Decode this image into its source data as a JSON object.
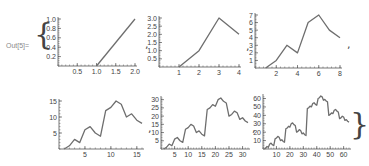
{
  "output_label": "Out[5]=",
  "open_brace": "{",
  "close_brace": "}",
  "separator": ",",
  "colors": {
    "line": "#6e6e6e",
    "axis": "#555555",
    "tick_label": "#444444"
  },
  "chart_data": [
    {
      "type": "line",
      "x": [
        1,
        2
      ],
      "values": [
        0,
        1
      ],
      "xticks": [
        0.5,
        1.0,
        1.5,
        2.0
      ],
      "xtick_labels": [
        "0.5",
        "1.0",
        "1.5",
        "2.0"
      ],
      "yticks": [
        0.2,
        0.4,
        0.6,
        0.8,
        1.0
      ],
      "ytick_labels": [
        "0.2",
        "0.4",
        "0.6",
        "0.8",
        "1.0"
      ],
      "xlim": [
        0,
        2
      ],
      "ylim": [
        0,
        1
      ],
      "frame": {
        "x0": 58,
        "x1": 135,
        "y0": 66,
        "y1": 19
      }
    },
    {
      "type": "line",
      "x": [
        1,
        2,
        3,
        4
      ],
      "values": [
        0,
        1,
        3,
        2
      ],
      "xticks": [
        1,
        2,
        3,
        4
      ],
      "xtick_labels": [
        "1",
        "2",
        "3",
        "4"
      ],
      "yticks": [
        0.5,
        1.0,
        1.5,
        2.0,
        2.5,
        3.0
      ],
      "ytick_labels": [
        "0.5",
        "1.0",
        "1.5",
        "2.0",
        "2.5",
        "3.0"
      ],
      "xlim": [
        0,
        4
      ],
      "ylim": [
        0,
        3
      ],
      "frame": {
        "x0": 159,
        "x1": 239,
        "y0": 67,
        "y1": 18
      }
    },
    {
      "type": "line",
      "x": [
        1,
        2,
        3,
        4,
        5,
        6,
        7,
        8
      ],
      "values": [
        0,
        1,
        3,
        2,
        6,
        7,
        5,
        4
      ],
      "xticks": [
        2,
        4,
        6,
        8
      ],
      "xtick_labels": [
        "2",
        "4",
        "6",
        "8"
      ],
      "yticks": [
        1,
        2,
        3,
        4,
        5,
        6,
        7
      ],
      "ytick_labels": [
        "1",
        "2",
        "3",
        "4",
        "5",
        "6",
        "7"
      ],
      "xlim": [
        0,
        8
      ],
      "ylim": [
        0,
        7
      ],
      "frame": {
        "x0": 255,
        "x1": 340,
        "y0": 68,
        "y1": 15
      }
    },
    {
      "type": "line",
      "x": [
        1,
        2,
        3,
        4,
        5,
        6,
        7,
        8,
        9,
        10,
        11,
        12,
        13,
        14,
        15,
        16
      ],
      "values": [
        0,
        1,
        3,
        2,
        6,
        7,
        5,
        4,
        12,
        13,
        15,
        14,
        10,
        11,
        9,
        8
      ],
      "xticks": [
        5,
        10,
        15
      ],
      "xtick_labels": [
        "5",
        "10",
        "15"
      ],
      "yticks": [
        5,
        10,
        15
      ],
      "ytick_labels": [
        "5",
        "10",
        "15"
      ],
      "xlim": [
        0,
        16
      ],
      "ylim": [
        0,
        15
      ],
      "frame": {
        "x0": 59,
        "x1": 142,
        "y0": 149,
        "y1": 101
      }
    },
    {
      "type": "line",
      "x": [
        1,
        2,
        3,
        4,
        5,
        6,
        7,
        8,
        9,
        10,
        11,
        12,
        13,
        14,
        15,
        16,
        17,
        18,
        19,
        20,
        21,
        22,
        23,
        24,
        25,
        26,
        27,
        28,
        29,
        30,
        31,
        32
      ],
      "values": [
        0,
        1,
        3,
        2,
        6,
        7,
        5,
        4,
        12,
        13,
        15,
        14,
        10,
        11,
        9,
        8,
        24,
        25,
        27,
        26,
        30,
        31,
        29,
        28,
        20,
        21,
        23,
        22,
        18,
        19,
        17,
        16
      ],
      "xticks": [
        5,
        10,
        15,
        20,
        25,
        30
      ],
      "xtick_labels": [
        "5",
        "10",
        "15",
        "20",
        "25",
        "30"
      ],
      "yticks": [
        5,
        10,
        15,
        20,
        25,
        30
      ],
      "ytick_labels": [
        "5",
        "10",
        "15",
        "20",
        "25",
        "30"
      ],
      "xlim": [
        0,
        32
      ],
      "ylim": [
        0,
        31
      ],
      "frame": {
        "x0": 161,
        "x1": 248,
        "y0": 149,
        "y1": 98
      }
    },
    {
      "type": "line",
      "x": [
        1,
        2,
        3,
        4,
        5,
        6,
        7,
        8,
        9,
        10,
        11,
        12,
        13,
        14,
        15,
        16,
        17,
        18,
        19,
        20,
        21,
        22,
        23,
        24,
        25,
        26,
        27,
        28,
        29,
        30,
        31,
        32,
        33,
        34,
        35,
        36,
        37,
        38,
        39,
        40,
        41,
        42,
        43,
        44,
        45,
        46,
        47,
        48,
        49,
        50,
        51,
        52,
        53,
        54,
        55,
        56,
        57,
        58,
        59,
        60,
        61,
        62,
        63,
        64
      ],
      "values": [
        0,
        1,
        3,
        2,
        6,
        7,
        5,
        4,
        12,
        13,
        15,
        14,
        10,
        11,
        9,
        8,
        24,
        25,
        27,
        26,
        30,
        31,
        29,
        28,
        20,
        21,
        23,
        22,
        18,
        19,
        17,
        16,
        48,
        49,
        51,
        50,
        54,
        55,
        53,
        52,
        60,
        61,
        63,
        62,
        58,
        59,
        57,
        56,
        40,
        41,
        43,
        42,
        46,
        47,
        45,
        44,
        36,
        37,
        39,
        38,
        34,
        35,
        33,
        32
      ],
      "xticks": [
        10,
        20,
        30,
        40,
        50,
        60
      ],
      "xtick_labels": [
        "10",
        "20",
        "30",
        "40",
        "50",
        "60"
      ],
      "yticks": [
        10,
        20,
        30,
        40,
        50,
        60
      ],
      "ytick_labels": [
        "10",
        "20",
        "30",
        "40",
        "50",
        "60"
      ],
      "xlim": [
        0,
        64
      ],
      "ylim": [
        0,
        63
      ],
      "frame": {
        "x0": 263,
        "x1": 349,
        "y0": 149,
        "y1": 96
      }
    }
  ]
}
